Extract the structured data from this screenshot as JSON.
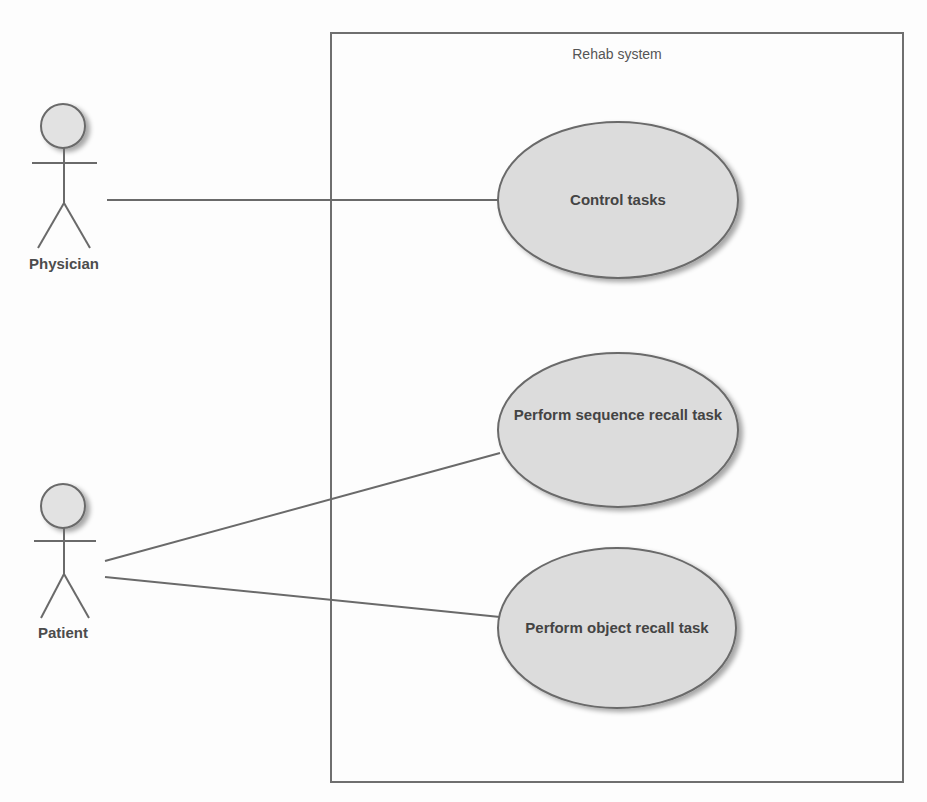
{
  "diagram": {
    "type": "uml-use-case",
    "system": {
      "title": "Rehab system"
    },
    "actors": [
      {
        "id": "physician",
        "label": "Physician"
      },
      {
        "id": "patient",
        "label": "Patient"
      }
    ],
    "use_cases": [
      {
        "id": "control-tasks",
        "label": "Control tasks"
      },
      {
        "id": "sequence-recall",
        "label": "Perform sequence recall task"
      },
      {
        "id": "object-recall",
        "label": "Perform object recall task"
      }
    ],
    "associations": [
      {
        "from": "physician",
        "to": "control-tasks"
      },
      {
        "from": "patient",
        "to": "sequence-recall"
      },
      {
        "from": "patient",
        "to": "object-recall"
      }
    ],
    "colors": {
      "stroke": "#6a6a6a",
      "usecase_fill": "#dcdcdc",
      "actor_head_fill": "#e2e2e2",
      "text": "#444444",
      "background": "#fdfdfd"
    }
  }
}
